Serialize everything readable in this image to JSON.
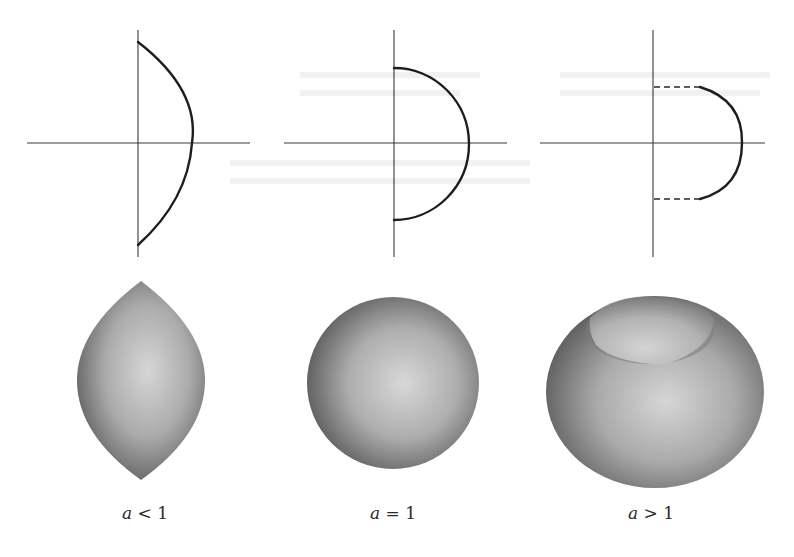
{
  "figure": {
    "colors": {
      "background": "#ffffff",
      "axis": "#3a3a3a",
      "curve": "#1e1e1e",
      "surface_light": "#dcdcdc",
      "surface_mid": "#a8a8a8",
      "surface_dark": "#5e5e5e"
    },
    "panels": [
      {
        "id": "a-less-than-1",
        "caption": {
          "variable": "a",
          "relation": "<",
          "value": "1"
        },
        "profile": {
          "shape": "lens-arc",
          "dashed_segments": false,
          "description": "Arc meeting the vertical axis at sharp corners (top and bottom)"
        },
        "surface": {
          "shape": "lemon / spindle",
          "description": "Pointed at the poles"
        }
      },
      {
        "id": "a-equal-1",
        "caption": {
          "variable": "a",
          "relation": "=",
          "value": "1"
        },
        "profile": {
          "shape": "semicircle",
          "dashed_segments": false,
          "description": "Semicircle meeting the vertical axis at right angles"
        },
        "surface": {
          "shape": "sphere",
          "description": "Round sphere"
        }
      },
      {
        "id": "a-greater-than-1",
        "caption": {
          "variable": "a",
          "relation": ">",
          "value": "1"
        },
        "profile": {
          "shape": "arc with dashed horizontal connectors",
          "dashed_segments": true,
          "description": "Arc ending before the axis; dashed horizontal lines connect its ends to the vertical axis"
        },
        "surface": {
          "shape": "apple / spindle-torus with dimple",
          "description": "Flattened sphere with a recessed cap on top"
        }
      }
    ]
  }
}
